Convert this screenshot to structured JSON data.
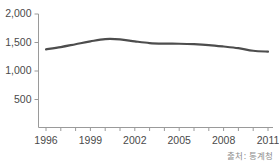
{
  "chart_data": {
    "type": "line",
    "title": "",
    "subtitle": "",
    "xlabel": "",
    "ylabel": "",
    "x": [
      1996,
      1997,
      1998,
      1999,
      2000,
      2001,
      2002,
      2003,
      2004,
      2005,
      2006,
      2007,
      2008,
      2009,
      2010,
      2011
    ],
    "series": [
      {
        "name": "",
        "values": [
          1380,
          1420,
          1470,
          1520,
          1560,
          1555,
          1520,
          1490,
          1480,
          1478,
          1470,
          1455,
          1430,
          1400,
          1355,
          1340
        ]
      }
    ],
    "y_ticks": [
      500,
      1000,
      1500,
      2000
    ],
    "y_tick_labels": [
      "500",
      "1,000",
      "1,500",
      "2,000"
    ],
    "ylim": [
      0,
      2000
    ],
    "x_tick_labels": [
      "1996",
      "1999",
      "2002",
      "2005",
      "2008",
      "2011"
    ],
    "x_tick_values": [
      1996,
      1999,
      2002,
      2005,
      2008,
      2011
    ],
    "xlim": [
      1996,
      2011
    ],
    "grid": false,
    "legend": "none",
    "line_color": "#4d4d4d",
    "axis_color": "#9a9a9a",
    "text_color": "#4a4a4a"
  },
  "footer": {
    "source_note": "출처: 통계청"
  }
}
